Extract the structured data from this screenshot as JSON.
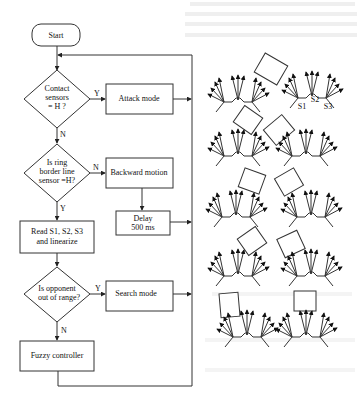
{
  "flowchart": {
    "start": "Start",
    "decision_contact": [
      "Contact",
      "sensors",
      "= H ?"
    ],
    "attack": "Attack mode",
    "decision_border": [
      "Is ring",
      "border line",
      "sensor =H?"
    ],
    "backward": "Backward motion",
    "delay": [
      "Delay",
      "500 ms"
    ],
    "read": [
      "Read S1, S2, S3",
      "and linearize"
    ],
    "decision_range": [
      "Is opponent",
      "out of range?"
    ],
    "search": "Search mode",
    "fuzzy": "Fuzzy controller",
    "labels": {
      "contact_yes": "Y",
      "contact_no": "N",
      "border_no": "N",
      "border_yes": "Y",
      "range_yes": "Y",
      "range_no": "N"
    }
  },
  "robots": {
    "sensor_labels": [
      "S1",
      "S2",
      "S3"
    ],
    "scenarios": [
      {
        "name": "scenario-1"
      },
      {
        "name": "scenario-2"
      },
      {
        "name": "scenario-3"
      },
      {
        "name": "scenario-4"
      },
      {
        "name": "scenario-5"
      },
      {
        "name": "scenario-6"
      },
      {
        "name": "scenario-7"
      },
      {
        "name": "scenario-8"
      }
    ]
  }
}
